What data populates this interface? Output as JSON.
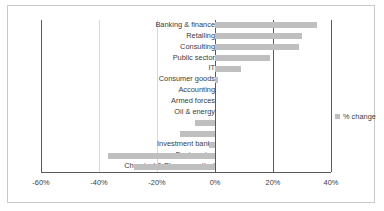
{
  "chart_data": {
    "type": "bar",
    "orientation": "horizontal",
    "title": "",
    "xlabel": "",
    "ylabel": "",
    "xlim": [
      -60,
      40
    ],
    "xticks": [
      -60,
      -40,
      -20,
      0,
      20,
      40
    ],
    "xtick_labels": [
      "-60%",
      "-40%",
      "-20%",
      "0%",
      "20%",
      "40%"
    ],
    "grid": true,
    "legend_position": "right",
    "legend": [
      "% change"
    ],
    "bar_color": "#bfbfbf",
    "categories": [
      "Banking & finance",
      "Retailing",
      "Consulting",
      "Public sector",
      "IT",
      "Consumer goods",
      "Accounting",
      "Armed forces",
      "Oil & energy",
      "Law",
      "Media",
      "Investment banks",
      "Engineering",
      "Chemical & Pharmaceutical"
    ],
    "series": [
      {
        "name": "% change",
        "values": [
          35,
          30,
          29,
          19,
          9,
          1,
          0,
          0,
          0,
          -7,
          -12,
          -2,
          -37,
          -28
        ]
      }
    ]
  },
  "legend": {
    "label": "% change"
  },
  "ticks": {
    "t0": "-60%",
    "t1": "-40%",
    "t2": "-20%",
    "t3": "0%",
    "t4": "20%",
    "t5": "40%"
  },
  "labels": {
    "l0": "Banking & finance",
    "l1": "Retailing",
    "l2": "Consulting",
    "l3": "Public sector",
    "l4": "IT",
    "l5": "Consumer goods",
    "l6": "Accounting",
    "l7": "Armed forces",
    "l8": "Oil & energy",
    "l9": "Law",
    "l10": "Media",
    "l11": "Investment banks",
    "l12": "Engineering",
    "l13": "Chemical & Pharmaceutical"
  }
}
